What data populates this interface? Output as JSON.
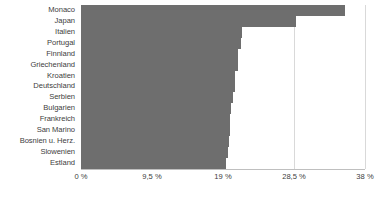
{
  "chart_data": {
    "type": "bar",
    "orientation": "horizontal",
    "title": "",
    "subtitle": "",
    "xlabel": "",
    "ylabel": "",
    "grid": true,
    "legend": false,
    "xlim": [
      0,
      38
    ],
    "axis_tick_labels": [
      "0 %",
      "9,5 %",
      "19 %",
      "28,5 %",
      "38 %"
    ],
    "axis_tick_values": [
      0,
      9.5,
      19,
      28.5,
      38
    ],
    "categories": [
      "Monaco",
      "Japan",
      "Italien",
      "Portugal",
      "Finnland",
      "Griechenland",
      "Kroatien",
      "Deutschland",
      "Serbien",
      "Bulgarien",
      "Frankreich",
      "San Marino",
      "Bosnien u. Herz.",
      "Slowenien",
      "Estland"
    ],
    "values": [
      35.3,
      28.8,
      21.5,
      21.4,
      21.0,
      21.0,
      20.6,
      20.6,
      20.3,
      20.1,
      19.9,
      19.9,
      19.8,
      19.7,
      19.4
    ],
    "bar_color": "#6e6e6e",
    "grid_color": "#d9d9d9",
    "text_color": "#404040",
    "background": "#ffffff"
  }
}
